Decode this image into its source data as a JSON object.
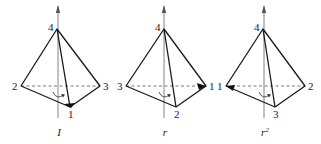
{
  "diagrams": [
    {
      "caption": "I",
      "caption_sup": "",
      "apex": {
        "label": "4",
        "x": 57,
        "y": 29
      },
      "left": {
        "label": "2",
        "x": 21,
        "y": 86
      },
      "right": {
        "label": "3",
        "x": 100,
        "y": 86
      },
      "front": {
        "label": "1",
        "x": 70,
        "y": 107
      },
      "marked_vertex": "front",
      "axis_x": 58
    },
    {
      "caption": "r",
      "caption_sup": "",
      "apex": {
        "label": "4",
        "x": 164,
        "y": 29
      },
      "left": {
        "label": "3",
        "x": 126,
        "y": 86
      },
      "right": {
        "label": "1",
        "x": 206,
        "y": 86
      },
      "front": {
        "label": "2",
        "x": 176,
        "y": 107
      },
      "marked_vertex": "right",
      "axis_x": 164
    },
    {
      "caption": "r",
      "caption_sup": "2",
      "apex": {
        "label": "4",
        "x": 263,
        "y": 29
      },
      "left": {
        "label": "1",
        "x": 226,
        "y": 86
      },
      "right": {
        "label": "2",
        "x": 305,
        "y": 86
      },
      "front": {
        "label": "3",
        "x": 275,
        "y": 107
      },
      "marked_vertex": "left",
      "axis_x": 264
    }
  ]
}
